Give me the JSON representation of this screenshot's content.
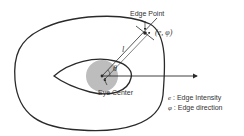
{
  "diagram": {
    "labels": {
      "edge_point": "Edge Point",
      "edge_tuple": "(e, φ)",
      "length_symbol": "l",
      "angle_symbol": "θ",
      "eye_center": "Eye Center"
    },
    "legend": [
      {
        "symbol": "e",
        "description": ": Edge Intensity"
      },
      {
        "symbol": "φ",
        "description": ": Edge direction"
      }
    ],
    "colors": {
      "stroke": "#2a2a2a",
      "pupil_fill": "#bdbdbd",
      "text": "#333333"
    }
  }
}
